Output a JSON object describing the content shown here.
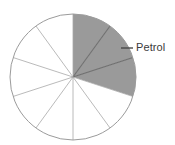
{
  "chart_data": {
    "type": "pie",
    "title": "",
    "subtitle": "",
    "xlabel": "",
    "ylabel": "",
    "grid": false,
    "legend_position": "callout-right",
    "total_slices": 10,
    "slice_angle_degrees": 36,
    "start_angle_degrees": 0,
    "direction": "clockwise",
    "categories": [
      "Petrol",
      "Petrol",
      "Petrol",
      "",
      "",
      "",
      "",
      "",
      "",
      ""
    ],
    "values": [
      10,
      10,
      10,
      10,
      10,
      10,
      10,
      10,
      10,
      10
    ],
    "slices": [
      {
        "index": 0,
        "start": 0,
        "end": 36,
        "fill": "#9a9a9a",
        "label": "Petrol",
        "shaded": true
      },
      {
        "index": 1,
        "start": 36,
        "end": 72,
        "fill": "#9a9a9a",
        "label": "Petrol",
        "shaded": true
      },
      {
        "index": 2,
        "start": 72,
        "end": 108,
        "fill": "#9a9a9a",
        "label": "Petrol",
        "shaded": true
      },
      {
        "index": 3,
        "start": 108,
        "end": 144,
        "fill": "#ffffff",
        "label": "",
        "shaded": false
      },
      {
        "index": 4,
        "start": 144,
        "end": 180,
        "fill": "#ffffff",
        "label": "",
        "shaded": false
      },
      {
        "index": 5,
        "start": 180,
        "end": 216,
        "fill": "#ffffff",
        "label": "",
        "shaded": false
      },
      {
        "index": 6,
        "start": 216,
        "end": 252,
        "fill": "#ffffff",
        "label": "",
        "shaded": false
      },
      {
        "index": 7,
        "start": 252,
        "end": 288,
        "fill": "#ffffff",
        "label": "",
        "shaded": false
      },
      {
        "index": 8,
        "start": 288,
        "end": 324,
        "fill": "#ffffff",
        "label": "",
        "shaded": false
      },
      {
        "index": 9,
        "start": 324,
        "end": 360,
        "fill": "#ffffff",
        "label": "",
        "shaded": false
      }
    ],
    "shaded_slice_count": 3,
    "shaded_fraction": "3/10",
    "annotations": [
      {
        "text": "Petrol",
        "target_slice": 1,
        "leader_line": true
      }
    ]
  },
  "callout": {
    "label": "Petrol"
  },
  "colors": {
    "background": "#ffffff",
    "shaded_fill": "#9a9a9a",
    "unshaded_fill": "#ffffff",
    "outline": "#9b9b9b",
    "divider_light": "#a8a8a8",
    "divider_dark": "#6e6e6e",
    "leader_line": "#4a4a4a",
    "text": "#3a3a3a"
  },
  "geometry": {
    "center_x": 73,
    "center_y": 77,
    "radius": 63
  }
}
